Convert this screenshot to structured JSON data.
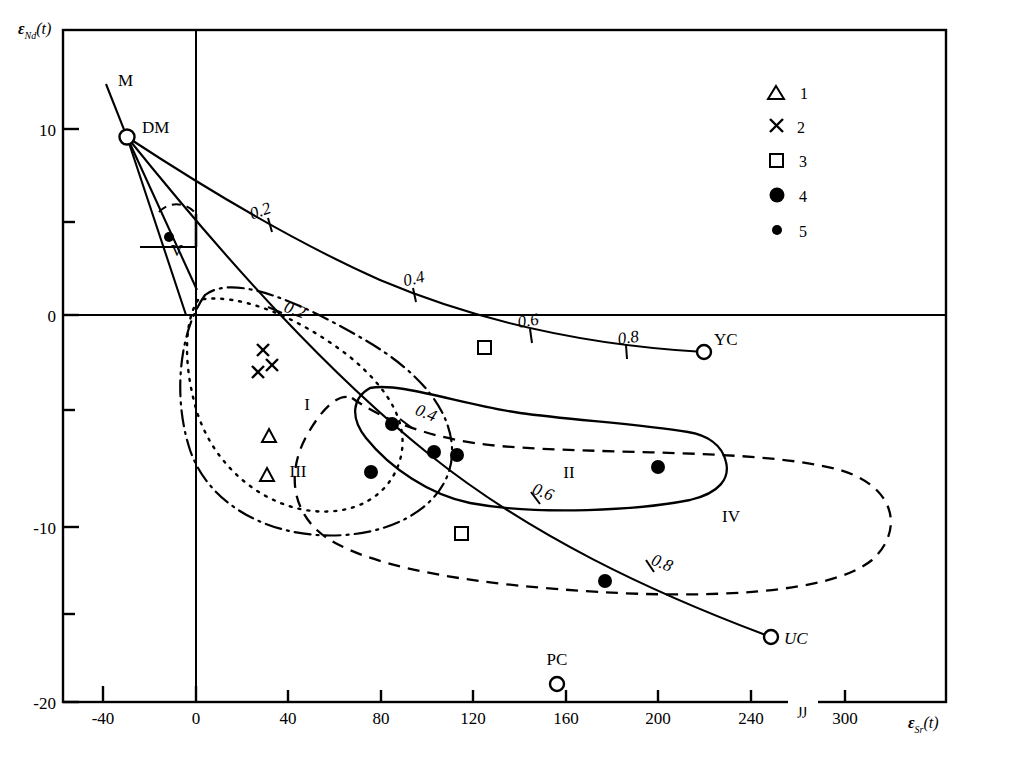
{
  "figure": {
    "type": "scatter",
    "axes": {
      "x": {
        "label": "εSr(t)",
        "label_main": "ε",
        "label_sub": "Sr",
        "label_arg": "(t)",
        "ticks": [
          "-40",
          "0",
          "40",
          "80",
          "120",
          "160",
          "200",
          "240",
          "300"
        ],
        "tick_values": [
          -40,
          0,
          40,
          80,
          120,
          160,
          200,
          240,
          300
        ],
        "break_symbol": "∫∫",
        "range": [
          -40,
          320
        ]
      },
      "y": {
        "label": "εNd(t)",
        "label_main": "ε",
        "label_sub": "Nd",
        "label_arg": "(t)",
        "ticks": [
          "10",
          "0",
          "-10",
          "-20"
        ],
        "tick_values": [
          10,
          0,
          -10,
          -20
        ],
        "minor_tick_values": [
          5,
          -5,
          -15
        ],
        "range": [
          -20,
          13.5
        ]
      }
    },
    "endmembers": [
      {
        "name": "DM",
        "x": -30,
        "y": 9.7,
        "marker": "open-circle"
      },
      {
        "name": "YC",
        "x": 220,
        "y": -3.3,
        "marker": "open-circle"
      },
      {
        "name": "UC",
        "x": 248,
        "y": -16.5,
        "marker": "open-circle"
      },
      {
        "name": "PC",
        "x": 153,
        "y": -19.1,
        "marker": "open-circle"
      },
      {
        "name": "M",
        "x": -34,
        "y": 12.4,
        "marker": "line-end"
      }
    ],
    "mixing_curves": [
      {
        "name": "DM-YC",
        "tick_labels": [
          "0.2",
          "0.4",
          "0.6",
          "0.8"
        ],
        "tick_fractions": [
          0.2,
          0.4,
          0.6,
          0.8
        ]
      },
      {
        "name": "DM-UC",
        "tick_labels": [
          "0.2",
          "0.4",
          "0.6",
          "0.8"
        ],
        "tick_fractions": [
          0.2,
          0.4,
          0.6,
          0.8
        ]
      }
    ],
    "regions": [
      {
        "label": "I",
        "x": 48,
        "y": -5.6
      },
      {
        "label": "II",
        "x": 170,
        "y": -7.8
      },
      {
        "label": "III",
        "x": 44,
        "y": -8.2
      },
      {
        "label": "IV",
        "x": 228,
        "y": -10.2
      },
      {
        "label": "V",
        "x": -22,
        "y": 3.4
      }
    ],
    "legend": {
      "items": [
        {
          "marker": "open-triangle",
          "label": "1"
        },
        {
          "marker": "cross",
          "label": "2"
        },
        {
          "marker": "open-square",
          "label": "3"
        },
        {
          "marker": "filled-circle-large",
          "label": "4"
        },
        {
          "marker": "filled-circle-small",
          "label": "5"
        }
      ]
    },
    "data_points": [
      {
        "series": "1",
        "marker": "open-triangle",
        "x": 32,
        "y": -6.4
      },
      {
        "series": "1",
        "marker": "open-triangle",
        "x": 31,
        "y": -8.1
      },
      {
        "series": "2",
        "marker": "cross",
        "x": 33,
        "y": -1.7
      },
      {
        "series": "2",
        "marker": "cross",
        "x": 37,
        "y": -2.4
      },
      {
        "series": "2",
        "marker": "cross",
        "x": 31,
        "y": -3.0
      },
      {
        "series": "3",
        "marker": "open-square",
        "x": 124,
        "y": -1.5
      },
      {
        "series": "3",
        "marker": "open-square",
        "x": 114,
        "y": -11.2
      },
      {
        "series": "4",
        "marker": "filled-circle-large",
        "x": 85,
        "y": -5.6
      },
      {
        "series": "4",
        "marker": "filled-circle-large",
        "x": 103,
        "y": -6.9
      },
      {
        "series": "4",
        "marker": "filled-circle-large",
        "x": 113,
        "y": -7.1
      },
      {
        "series": "4",
        "marker": "filled-circle-large",
        "x": 200,
        "y": -7.7
      },
      {
        "series": "4",
        "marker": "filled-circle-large",
        "x": 76,
        "y": -8.1
      },
      {
        "series": "4",
        "marker": "filled-circle-large",
        "x": 172,
        "y": -13.7
      },
      {
        "series": "5",
        "marker": "filled-circle-small",
        "x": -8,
        "y": 4.2
      }
    ]
  }
}
